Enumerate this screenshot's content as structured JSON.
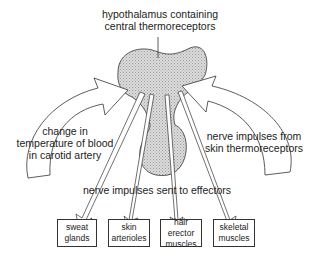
{
  "diagram": {
    "type": "thermoregulation-flow",
    "centre_label": {
      "line1": "hypothalamus containing",
      "line2": "central thermoreceptors"
    },
    "left_input": {
      "line1": "change in",
      "line2": "temperature of blood",
      "line3": "in carotid artery"
    },
    "right_input": {
      "line1": "nerve impulses from",
      "line2": "skin thermoreceptors"
    },
    "output_label": "nerve impulses sent to effectors",
    "effectors": [
      {
        "line1": "sweat",
        "line2": "glands"
      },
      {
        "line1": "skin",
        "line2": "arterioles"
      },
      {
        "line1": "hair erector",
        "line2": "muscles"
      },
      {
        "line1": "skeletal",
        "line2": "muscles"
      }
    ],
    "colors": {
      "hypothalamus_fill": "#d4d4d4",
      "stroke": "#333333",
      "background": "#ffffff"
    }
  }
}
